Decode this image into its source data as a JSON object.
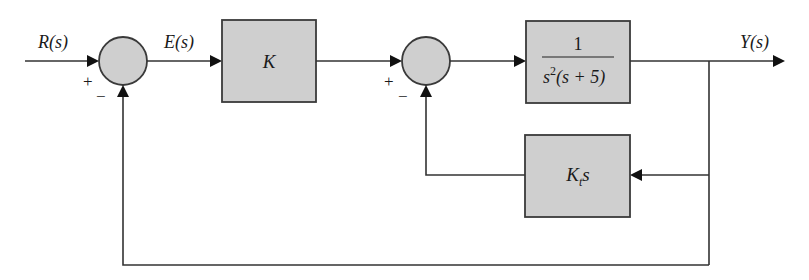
{
  "diagram": {
    "colors": {
      "block_fill": "#cfcfcf",
      "block_stroke": "#3a3a3a",
      "wire": "#333333",
      "background": "#ffffff"
    },
    "signals": {
      "input": "R(s)",
      "error": "E(s)",
      "output": "Y(s)"
    },
    "summing_junctions": [
      {
        "id": "sum1",
        "plus_sign": "+",
        "minus_sign": "−"
      },
      {
        "id": "sum2",
        "plus_sign": "+",
        "minus_sign": "−"
      }
    ],
    "blocks": {
      "gain": {
        "label": "K"
      },
      "plant": {
        "numerator": "1",
        "denominator_base": "s",
        "denominator_exp": "2",
        "denominator_rest": "(s + 5)"
      },
      "rate_feedback": {
        "label_base": "K",
        "label_sub": "t",
        "label_rest": "s"
      }
    },
    "connections": [
      "R(s) -> sum1 (+)",
      "sum1 -> E(s) -> K",
      "K -> sum2 (+)",
      "sum2 -> 1/(s^2(s+5))",
      "1/(s^2(s+5)) -> Y(s)",
      "Y(s) -> K_t s -> sum2 (−)",
      "Y(s) -> sum1 (−)"
    ]
  }
}
